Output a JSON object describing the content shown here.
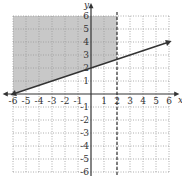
{
  "chart_data": {
    "type": "line",
    "title": "",
    "xlabel": "x",
    "ylabel": "y",
    "xlim": [
      -6,
      6
    ],
    "ylim": [
      -6,
      6
    ],
    "grid": true,
    "x_ticks": [
      "-6",
      "-5",
      "-4",
      "-3",
      "-2",
      "-1",
      "1",
      "2",
      "3",
      "4",
      "5",
      "6"
    ],
    "y_ticks": [
      "6",
      "5",
      "4",
      "3",
      "2",
      "1",
      "-1",
      "-2",
      "-3",
      "-4",
      "-5",
      "-6"
    ],
    "series": [
      {
        "name": "boundary line",
        "style": "solid",
        "equation": "y = x/3 + 2",
        "x": [
          -6,
          6
        ],
        "y": [
          0,
          4
        ]
      },
      {
        "name": "vertical boundary",
        "style": "dashed",
        "equation": "x = 2",
        "x": [
          2,
          2
        ],
        "y": [
          -6,
          6
        ]
      }
    ],
    "shaded_region": {
      "description": "y >= x/3 + 2 and x <= 2",
      "vertices": [
        [
          -6,
          0
        ],
        [
          2,
          2.667
        ],
        [
          2,
          6
        ],
        [
          -6,
          6
        ]
      ],
      "color": "#c8c8c8"
    }
  },
  "colors": {
    "shade": "#c8c8c8",
    "line": "#333333",
    "grid": "#999999",
    "axis": "#333333"
  }
}
